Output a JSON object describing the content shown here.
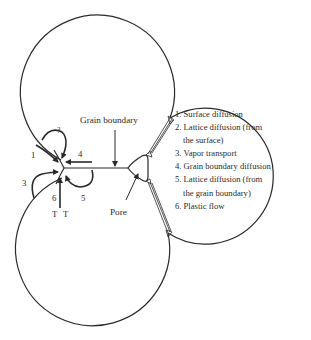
{
  "diagram": {
    "type": "sintering-mechanisms",
    "labels": {
      "grain_boundary": "Grain boundary",
      "pore": "Pore",
      "mech_1": "1",
      "mech_2": "?",
      "mech_3": "3",
      "mech_4": "4",
      "mech_5": "5",
      "mech_6": "6",
      "t_left": "T",
      "t_right": "T"
    },
    "legend": [
      {
        "text": "1. Surface diffusion"
      },
      {
        "text": "2. Lattice diffusion (from",
        "cont": "the surface)"
      },
      {
        "text": "3. Vapor transport"
      },
      {
        "text": "4. Grain boundary diffusion"
      },
      {
        "text": "5. Lattice diffusion (from",
        "cont": "the grain boundary)"
      },
      {
        "text": "6. Plastic flow"
      }
    ],
    "colors": {
      "stroke": "#2a2a2a",
      "background": "#ffffff"
    }
  }
}
